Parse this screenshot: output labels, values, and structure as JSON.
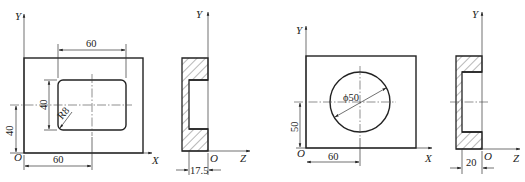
{
  "figure": {
    "views": [
      {
        "id": "view1",
        "description": "Front view of plate with rounded rectangular pocket",
        "axes": {
          "vertical": "Y",
          "horizontal": "X",
          "origin": "O"
        },
        "dimensions": {
          "pocket_width": "60",
          "pocket_height": "40",
          "corner_radius": "R8",
          "center_y": "40",
          "center_x": "60"
        }
      },
      {
        "id": "view2",
        "description": "Side section view of plate with pocket",
        "axes": {
          "vertical": "Y",
          "horizontal": "Z",
          "origin": "O"
        },
        "dimensions": {
          "pocket_depth": "17.5"
        }
      },
      {
        "id": "view3",
        "description": "Front view of plate with circular pocket",
        "axes": {
          "vertical": "Y",
          "horizontal": "X",
          "origin": "O"
        },
        "dimensions": {
          "diameter": "ϕ50",
          "center_y": "50",
          "center_x": "60"
        }
      },
      {
        "id": "view4",
        "description": "Side section view of plate with circular pocket",
        "axes": {
          "vertical": "Y",
          "horizontal": "Z",
          "origin": "O"
        },
        "dimensions": {
          "pocket_depth": "20"
        }
      }
    ]
  }
}
